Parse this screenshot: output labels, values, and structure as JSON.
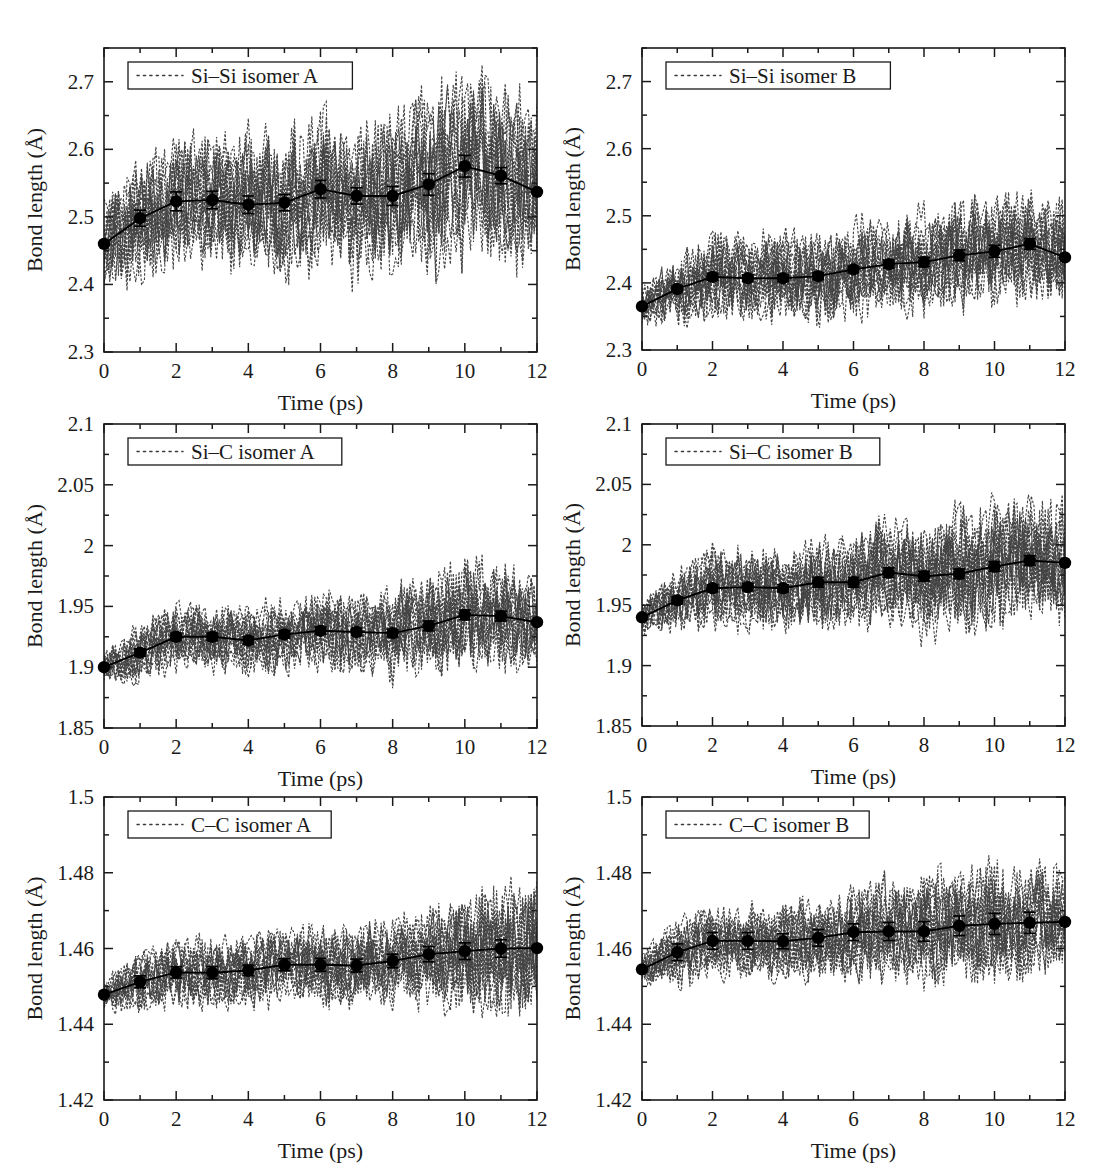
{
  "figure": {
    "title": "",
    "panel_count": 6,
    "layout": "3 rows x 2 columns"
  },
  "axis": {
    "xlabel": "Time (ps)",
    "ylabel": "Bond length (Å)"
  },
  "chart_data": [
    {
      "type": "line",
      "panel_id": "si-si-isomer-a",
      "title": "",
      "legend": "Si–Si isomer A",
      "legend_position": "top-left-inside",
      "xlabel": "Time (ps)",
      "ylabel": "Bond length (Å)",
      "xlim": [
        0,
        12
      ],
      "ylim": [
        2.3,
        2.75
      ],
      "xticks": [
        0,
        2,
        4,
        6,
        8,
        10,
        12
      ],
      "xticklabels": [
        "0",
        "2",
        "4",
        "6",
        "8",
        "10",
        "12"
      ],
      "xminorticks": [
        1,
        3,
        5,
        7,
        9,
        11
      ],
      "yticks": [
        2.3,
        2.4,
        2.5,
        2.6,
        2.7
      ],
      "yticklabels": [
        "2.3",
        "2.4",
        "2.5",
        "2.6",
        "2.7"
      ],
      "yminorticks": [
        2.35,
        2.45,
        2.55,
        2.65,
        2.75
      ],
      "grid": false,
      "x": [
        0,
        1,
        2,
        3,
        4,
        5,
        6,
        7,
        8,
        9,
        10,
        11,
        12
      ],
      "values": [
        2.46,
        2.498,
        2.523,
        2.525,
        2.518,
        2.521,
        2.541,
        2.531,
        2.531,
        2.548,
        2.575,
        2.561,
        2.537
      ],
      "errors": [
        0.0,
        0.012,
        0.014,
        0.013,
        0.013,
        0.012,
        0.013,
        0.012,
        0.014,
        0.016,
        0.016,
        0.012,
        0.0
      ],
      "noise_band": [
        0.055,
        0.075,
        0.078,
        0.08,
        0.08,
        0.082,
        0.086,
        0.09,
        0.095,
        0.105,
        0.112,
        0.11,
        0.105
      ],
      "noise_seed": 11
    },
    {
      "type": "line",
      "panel_id": "si-si-isomer-b",
      "title": "",
      "legend": "Si–Si isomer B",
      "legend_position": "top-left-inside",
      "xlabel": "Time (ps)",
      "ylabel": "Bond length (Å)",
      "xlim": [
        0,
        12
      ],
      "ylim": [
        2.3,
        2.75
      ],
      "xticks": [
        0,
        2,
        4,
        6,
        8,
        10,
        12
      ],
      "xticklabels": [
        "0",
        "2",
        "4",
        "6",
        "8",
        "10",
        "12"
      ],
      "xminorticks": [
        1,
        3,
        5,
        7,
        9,
        11
      ],
      "yticks": [
        2.3,
        2.4,
        2.5,
        2.6,
        2.7
      ],
      "yticklabels": [
        "2.3",
        "2.4",
        "2.5",
        "2.6",
        "2.7"
      ],
      "yminorticks": [
        2.35,
        2.45,
        2.55,
        2.65,
        2.75
      ],
      "grid": false,
      "x": [
        0,
        1,
        2,
        3,
        4,
        5,
        6,
        7,
        8,
        9,
        10,
        11,
        12
      ],
      "values": [
        2.365,
        2.391,
        2.409,
        2.407,
        2.407,
        2.41,
        2.42,
        2.428,
        2.431,
        2.441,
        2.447,
        2.458,
        2.438
      ],
      "errors": [
        0.0,
        0.004,
        0.005,
        0.005,
        0.005,
        0.005,
        0.005,
        0.006,
        0.007,
        0.008,
        0.009,
        0.008,
        0.0
      ],
      "noise_band": [
        0.022,
        0.042,
        0.05,
        0.05,
        0.052,
        0.052,
        0.055,
        0.058,
        0.06,
        0.062,
        0.064,
        0.066,
        0.06
      ],
      "noise_seed": 23
    },
    {
      "type": "line",
      "panel_id": "si-c-isomer-a",
      "title": "",
      "legend": "Si–C isomer A",
      "legend_position": "top-left-inside",
      "xlabel": "Time (ps)",
      "ylabel": "Bond length (Å)",
      "xlim": [
        0,
        12
      ],
      "ylim": [
        1.85,
        2.1
      ],
      "xticks": [
        0,
        2,
        4,
        6,
        8,
        10,
        12
      ],
      "xticklabels": [
        "0",
        "2",
        "4",
        "6",
        "8",
        "10",
        "12"
      ],
      "xminorticks": [
        1,
        3,
        5,
        7,
        9,
        11
      ],
      "yticks": [
        1.85,
        1.9,
        1.95,
        2.0,
        2.05,
        2.1
      ],
      "yticklabels": [
        "1.85",
        "1.9",
        "1.95",
        "2",
        "2.05",
        "2.1"
      ],
      "yminorticks": [
        1.875,
        1.925,
        1.975,
        2.025,
        2.075
      ],
      "grid": false,
      "x": [
        0,
        1,
        2,
        3,
        4,
        5,
        6,
        7,
        8,
        9,
        10,
        11,
        12
      ],
      "values": [
        1.9,
        1.912,
        1.925,
        1.925,
        1.922,
        1.927,
        1.93,
        1.929,
        1.928,
        1.934,
        1.943,
        1.942,
        1.937
      ],
      "errors": [
        0.0,
        0.003,
        0.003,
        0.003,
        0.003,
        0.003,
        0.003,
        0.003,
        0.003,
        0.004,
        0.004,
        0.004,
        0.0
      ],
      "noise_band": [
        0.01,
        0.02,
        0.022,
        0.022,
        0.023,
        0.024,
        0.025,
        0.026,
        0.03,
        0.034,
        0.036,
        0.034,
        0.032
      ],
      "noise_seed": 37
    },
    {
      "type": "line",
      "panel_id": "si-c-isomer-b",
      "title": "",
      "legend": "Si–C isomer B",
      "legend_position": "top-left-inside",
      "xlabel": "Time (ps)",
      "ylabel": "Bond length (Å)",
      "xlim": [
        0,
        12
      ],
      "ylim": [
        1.85,
        2.1
      ],
      "xticks": [
        0,
        2,
        4,
        6,
        8,
        10,
        12
      ],
      "xticklabels": [
        "0",
        "2",
        "4",
        "6",
        "8",
        "10",
        "12"
      ],
      "xminorticks": [
        1,
        3,
        5,
        7,
        9,
        11
      ],
      "yticks": [
        1.85,
        1.9,
        1.95,
        2.0,
        2.05,
        2.1
      ],
      "yticklabels": [
        "1.85",
        "1.9",
        "1.95",
        "2",
        "2.05",
        "2.1"
      ],
      "yminorticks": [
        1.875,
        1.925,
        1.975,
        2.025,
        2.075
      ],
      "grid": false,
      "x": [
        0,
        1,
        2,
        3,
        4,
        5,
        6,
        7,
        8,
        9,
        10,
        11,
        12
      ],
      "values": [
        1.94,
        1.954,
        1.964,
        1.965,
        1.964,
        1.969,
        1.969,
        1.977,
        1.974,
        1.976,
        1.982,
        1.987,
        1.985
      ],
      "errors": [
        0.0,
        0.003,
        0.003,
        0.003,
        0.003,
        0.004,
        0.004,
        0.004,
        0.004,
        0.004,
        0.004,
        0.004,
        0.0
      ],
      "noise_band": [
        0.01,
        0.022,
        0.026,
        0.028,
        0.028,
        0.03,
        0.032,
        0.036,
        0.038,
        0.04,
        0.042,
        0.042,
        0.038
      ],
      "noise_seed": 53
    },
    {
      "type": "line",
      "panel_id": "c-c-isomer-a",
      "title": "",
      "legend": "C–C isomer A",
      "legend_position": "top-left-inside",
      "xlabel": "Time (ps)",
      "ylabel": "Bond length (Å)",
      "xlim": [
        0,
        12
      ],
      "ylim": [
        1.42,
        1.5
      ],
      "xticks": [
        0,
        2,
        4,
        6,
        8,
        10,
        12
      ],
      "xticklabels": [
        "0",
        "2",
        "4",
        "6",
        "8",
        "10",
        "12"
      ],
      "xminorticks": [
        1,
        3,
        5,
        7,
        9,
        11
      ],
      "yticks": [
        1.42,
        1.44,
        1.46,
        1.48,
        1.5
      ],
      "yticklabels": [
        "1.42",
        "1.44",
        "1.46",
        "1.48",
        "1.5"
      ],
      "yminorticks": [
        1.43,
        1.45,
        1.47,
        1.49
      ],
      "grid": false,
      "x": [
        0,
        1,
        2,
        3,
        4,
        5,
        6,
        7,
        8,
        9,
        10,
        11,
        12
      ],
      "values": [
        1.4478,
        1.4512,
        1.4537,
        1.4536,
        1.4542,
        1.4557,
        1.4557,
        1.4555,
        1.4567,
        1.4585,
        1.4593,
        1.46,
        1.4601
      ],
      "errors": [
        0.0,
        0.0016,
        0.0015,
        0.0016,
        0.0014,
        0.0016,
        0.0017,
        0.0017,
        0.0018,
        0.002,
        0.0022,
        0.0023,
        0.0
      ],
      "noise_band": [
        0.0035,
        0.0065,
        0.0072,
        0.0075,
        0.0078,
        0.0082,
        0.0085,
        0.0088,
        0.0095,
        0.0105,
        0.0125,
        0.015,
        0.0145
      ],
      "noise_seed": 71
    },
    {
      "type": "line",
      "panel_id": "c-c-isomer-b",
      "title": "",
      "legend": "C–C isomer B",
      "legend_position": "top-left-inside",
      "xlabel": "Time (ps)",
      "ylabel": "Bond length (Å)",
      "xlim": [
        0,
        12
      ],
      "ylim": [
        1.42,
        1.5
      ],
      "xticks": [
        0,
        2,
        4,
        6,
        8,
        10,
        12
      ],
      "xticklabels": [
        "0",
        "2",
        "4",
        "6",
        "8",
        "10",
        "12"
      ],
      "xminorticks": [
        1,
        3,
        5,
        7,
        9,
        11
      ],
      "yticks": [
        1.42,
        1.44,
        1.46,
        1.48,
        1.5
      ],
      "yticklabels": [
        "1.42",
        "1.44",
        "1.46",
        "1.48",
        "1.5"
      ],
      "yminorticks": [
        1.43,
        1.45,
        1.47,
        1.49
      ],
      "grid": false,
      "x": [
        0,
        1,
        2,
        3,
        4,
        5,
        6,
        7,
        8,
        9,
        10,
        11,
        12
      ],
      "values": [
        1.4545,
        1.459,
        1.462,
        1.462,
        1.4619,
        1.4628,
        1.4643,
        1.4645,
        1.4645,
        1.466,
        1.4665,
        1.4668,
        1.467
      ],
      "errors": [
        0.0,
        0.0022,
        0.0022,
        0.0022,
        0.002,
        0.0022,
        0.0022,
        0.0024,
        0.0026,
        0.0026,
        0.0028,
        0.0028,
        0.0
      ],
      "noise_band": [
        0.0035,
        0.007,
        0.0078,
        0.008,
        0.0082,
        0.009,
        0.0095,
        0.0105,
        0.0115,
        0.0118,
        0.0122,
        0.012,
        0.0112
      ],
      "noise_seed": 97
    }
  ],
  "style": {
    "axis_color": "#1a1a1a",
    "line_color": "#000000",
    "marker_color": "#000000",
    "noise_color": "#3a3a3a",
    "background": "#ffffff"
  }
}
